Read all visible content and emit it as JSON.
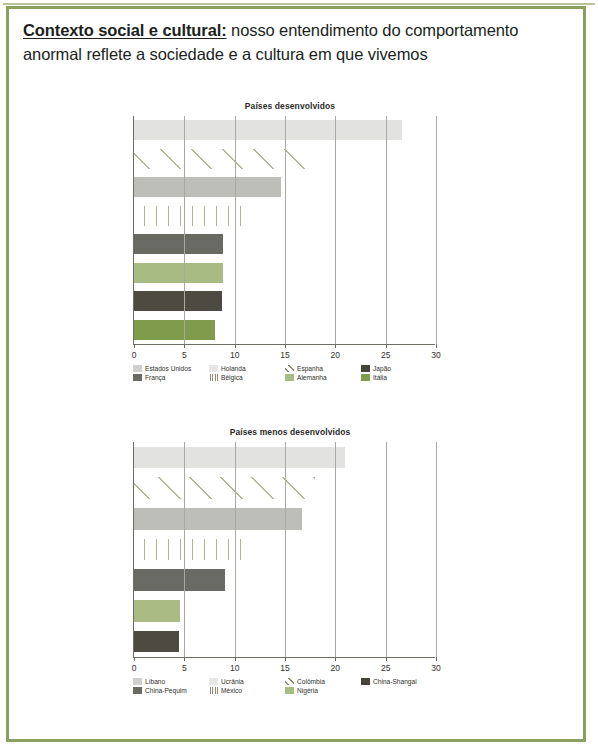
{
  "slide": {
    "headline_bold": "Contexto social e cultural:",
    "headline_rest": " nosso entendimento do comportamento anormal reflete a sociedade e a cultura em que vivemos",
    "border_color": "#8aa05c"
  },
  "chart_data": [
    {
      "id": "paises-desenvolvidos",
      "type": "bar",
      "orientation": "horizontal",
      "title": "Países desenvolvidos",
      "xlabel": "",
      "ylabel": "",
      "xlim": [
        0,
        30
      ],
      "xticks": [
        0,
        5,
        10,
        15,
        20,
        25,
        30
      ],
      "xticklabels": [
        "0",
        "5",
        "10",
        "15",
        "20",
        "25",
        "30"
      ],
      "grid": true,
      "legend_position": "bottom",
      "categories": [
        "Estados Unidos",
        "Holanda",
        "Espanha",
        "Japão",
        "França",
        "Bélgica",
        "Alemanha",
        "Itália"
      ],
      "values": [
        26.6,
        0,
        18.0,
        0,
        14.6,
        11.5,
        8.8,
        8.8
      ],
      "bars": [
        {
          "label": "Estados Unidos",
          "value": 26.6,
          "color": "#e2e2e0",
          "pattern": "solid"
        },
        {
          "label": "Espanha",
          "value": 18.0,
          "color": "#b6b79a",
          "pattern": "diagonal"
        },
        {
          "label": "França",
          "value": 14.6,
          "color": "#bdbdba",
          "pattern": "solid"
        },
        {
          "label": "Bélgica",
          "value": 11.5,
          "color": "#b3b497",
          "pattern": "vertical"
        },
        {
          "label": "Holanda",
          "value": 8.8,
          "color": "#6a6a64",
          "pattern": "solid"
        },
        {
          "label": "Alemanha",
          "value": 8.8,
          "color": "#a7bb82",
          "pattern": "solid"
        },
        {
          "label": "Japão",
          "value": 8.7,
          "color": "#4d4a42",
          "pattern": "solid"
        },
        {
          "label": "Itália",
          "value": 8.0,
          "color": "#7f9c4d",
          "pattern": "solid"
        }
      ],
      "legend": [
        {
          "label": "Estados Unidos",
          "color": "#cfcfcd",
          "pattern": "solid"
        },
        {
          "label": "Holanda",
          "color": "#e6e6e4",
          "pattern": "solid"
        },
        {
          "label": "Espanha",
          "color": "#ffffff",
          "pattern": "diagonal"
        },
        {
          "label": "Japão",
          "color": "#45433c",
          "pattern": "solid"
        },
        {
          "label": "França",
          "color": "#6a6a64",
          "pattern": "solid"
        },
        {
          "label": "Bélgica",
          "color": "#ffffff",
          "pattern": "vertical"
        },
        {
          "label": "Alemanha",
          "color": "#a7bb82",
          "pattern": "solid"
        },
        {
          "label": "Itália",
          "color": "#7f9c4d",
          "pattern": "solid"
        }
      ]
    },
    {
      "id": "paises-menos-desenvolvidos",
      "type": "bar",
      "orientation": "horizontal",
      "title": "Países menos desenvolvidos",
      "xlabel": "",
      "ylabel": "",
      "xlim": [
        0,
        30
      ],
      "xticks": [
        0,
        5,
        10,
        15,
        20,
        25,
        30
      ],
      "xticklabels": [
        "0",
        "5",
        "10",
        "15",
        "20",
        "25",
        "30"
      ],
      "grid": true,
      "legend_position": "bottom",
      "categories": [
        "Líbano",
        "Ucrânia",
        "Colômbia",
        "China-Shangai",
        "China-Pequim",
        "México",
        "Nigéria"
      ],
      "values": [
        21.0,
        18.0,
        16.7,
        11.5,
        9.0,
        4.6,
        4.5
      ],
      "bars": [
        {
          "label": "Líbano",
          "value": 21.0,
          "color": "#e2e2e0",
          "pattern": "solid"
        },
        {
          "label": "Ucrânia",
          "value": 18.0,
          "color": "#b6b79a",
          "pattern": "diagonal"
        },
        {
          "label": "Colômbia",
          "value": 16.7,
          "color": "#bdbdba",
          "pattern": "solid"
        },
        {
          "label": "China-Shangai",
          "value": 11.5,
          "color": "#b3b497",
          "pattern": "vertical"
        },
        {
          "label": "China-Pequim",
          "value": 9.0,
          "color": "#6a6a64",
          "pattern": "solid"
        },
        {
          "label": "México",
          "value": 4.6,
          "color": "#aabb84",
          "pattern": "solid"
        },
        {
          "label": "Nigéria",
          "value": 4.5,
          "color": "#4d4a42",
          "pattern": "solid"
        }
      ],
      "legend": [
        {
          "label": "Líbano",
          "color": "#cfcfcd",
          "pattern": "solid"
        },
        {
          "label": "Ucrânia",
          "color": "#e6e6e4",
          "pattern": "solid"
        },
        {
          "label": "Colômbia",
          "color": "#ffffff",
          "pattern": "diagonal"
        },
        {
          "label": "China-Shangai",
          "color": "#45433c",
          "pattern": "solid"
        },
        {
          "label": "China-Pequim",
          "color": "#6a6a64",
          "pattern": "solid"
        },
        {
          "label": "México",
          "color": "#ffffff",
          "pattern": "vertical"
        },
        {
          "label": "Nigéria",
          "color": "#a7bb82",
          "pattern": "solid"
        }
      ]
    }
  ]
}
